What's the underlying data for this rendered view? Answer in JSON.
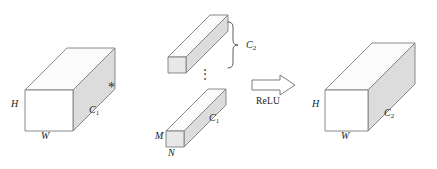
{
  "figure": {
    "colors": {
      "stroke": "#7d7d7d",
      "face_front": "#ffffff",
      "face_side": "#dcdcdc",
      "face_top": "#fbfbfb",
      "text": "#1a1a1a"
    }
  },
  "input_tensor": {
    "name": "input feature map",
    "height_label": "H",
    "width_label": "W",
    "depth_label": "C",
    "depth_sub": "1"
  },
  "operator": {
    "symbol": "*",
    "meaning": "convolution"
  },
  "filters": {
    "count_label": "C",
    "count_sub": "2",
    "ellipsis": "⋮",
    "top_filter": {
      "depth_label": "C",
      "depth_sub": "1"
    },
    "bottom_filter": {
      "height_label": "M",
      "width_label": "N",
      "depth_label": "C",
      "depth_sub": "1"
    }
  },
  "activation": {
    "arrow_label": "ReLU",
    "arrow_direction": "right"
  },
  "output_tensor": {
    "name": "output feature map",
    "height_label": "H",
    "width_label": "W",
    "depth_label": "C",
    "depth_sub": "2"
  }
}
